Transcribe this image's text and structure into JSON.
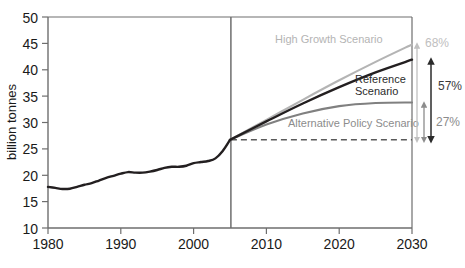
{
  "chart_data": {
    "type": "line",
    "title": "",
    "subtitle": "",
    "xlabel": "",
    "ylabel": "billion tonnes",
    "xlim": [
      1980,
      2030
    ],
    "ylim": [
      10,
      50
    ],
    "grid": false,
    "legend_position": "inline-annotations",
    "x_ticks": [
      "1980",
      "1990",
      "2000",
      "2010",
      "2020",
      "2030"
    ],
    "y_ticks": [
      "10",
      "15",
      "20",
      "25",
      "30",
      "35",
      "40",
      "45",
      "50"
    ],
    "divider_year": 2005,
    "divider_value": 26.7,
    "series": [
      {
        "name": "Historical",
        "color": "#231f20",
        "x": [
          1980,
          1981,
          1982,
          1983,
          1984,
          1985,
          1986,
          1987,
          1988,
          1989,
          1990,
          1991,
          1992,
          1993,
          1994,
          1995,
          1996,
          1997,
          1998,
          1999,
          2000,
          2001,
          2002,
          2003,
          2004,
          2005
        ],
        "values": [
          17.8,
          17.6,
          17.4,
          17.45,
          17.8,
          18.2,
          18.5,
          19.0,
          19.5,
          19.9,
          20.3,
          20.6,
          20.5,
          20.5,
          20.7,
          21.0,
          21.4,
          21.6,
          21.6,
          21.8,
          22.3,
          22.5,
          22.7,
          23.2,
          24.6,
          26.7
        ]
      },
      {
        "name": "High Growth Scenario",
        "color": "#b4b4b4",
        "x": [
          2005,
          2010,
          2015,
          2020,
          2025,
          2030
        ],
        "values": [
          26.7,
          30.5,
          34.3,
          38.0,
          41.5,
          44.8
        ]
      },
      {
        "name": "Reference Scenario",
        "color": "#231f20",
        "x": [
          2005,
          2010,
          2015,
          2020,
          2025,
          2030
        ],
        "values": [
          26.7,
          30.2,
          33.6,
          36.7,
          39.5,
          41.9
        ]
      },
      {
        "name": "Alternative Policy Scenario",
        "color": "#808080",
        "x": [
          2005,
          2010,
          2015,
          2020,
          2025,
          2030
        ],
        "values": [
          26.7,
          29.6,
          31.7,
          33.1,
          33.7,
          33.8
        ]
      }
    ],
    "annotations": [
      {
        "id": "high-growth-label",
        "text": "High Growth Scenario",
        "style": "light"
      },
      {
        "id": "reference-label-line1",
        "text": "Reference",
        "style": "dark"
      },
      {
        "id": "reference-label-line2",
        "text": "Scenario",
        "style": "dark"
      },
      {
        "id": "alternative-policy-label",
        "text": "Alternative Policy Scenario",
        "style": "mid"
      }
    ],
    "growth_markers": [
      {
        "id": "high-growth-pct",
        "text": "68%",
        "from": 26.7,
        "to": 44.8,
        "style": "light"
      },
      {
        "id": "reference-pct",
        "text": "57%",
        "from": 26.7,
        "to": 41.9,
        "style": "dark"
      },
      {
        "id": "alternative-policy-pct",
        "text": "27%",
        "from": 26.7,
        "to": 33.8,
        "style": "mid"
      }
    ]
  },
  "colors": {
    "historical": "#231f20",
    "high_growth": "#b4b4b4",
    "reference": "#231f20",
    "alternative_policy": "#808080",
    "axis": "#6e6e6e",
    "divider": "#6e6e6e",
    "dashed": "#6e6e6e",
    "background": "#ffffff"
  }
}
